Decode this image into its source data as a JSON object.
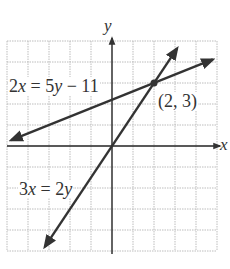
{
  "chart_data": {
    "type": "line",
    "title": "",
    "xlabel": "x",
    "ylabel": "y",
    "xlim": [
      -5,
      5
    ],
    "ylim": [
      -5,
      5
    ],
    "grid": true,
    "grid_step": 1,
    "tick_labels": false,
    "series": [
      {
        "name": "2x = 5y − 11",
        "equation": "y = (2x + 11) / 5",
        "slope": 0.4,
        "intercept": 2.2,
        "x": [
          -4.8,
          4.8
        ],
        "y": [
          0.28,
          4.12
        ]
      },
      {
        "name": "3x = 2y",
        "equation": "y = 1.5x",
        "slope": 1.5,
        "intercept": 0,
        "x": [
          -3.2,
          3.1
        ],
        "y": [
          -4.8,
          4.65
        ]
      }
    ],
    "annotations": [
      {
        "text": "(2, 3)",
        "x": 2,
        "y": 3,
        "type": "intersection-point"
      },
      {
        "text": "2x = 5y − 11",
        "target": "series.0"
      },
      {
        "text": "3x = 2y",
        "target": "series.1"
      }
    ]
  },
  "labels": {
    "x_axis": "x",
    "y_axis": "y",
    "eq1_a": "2",
    "eq1_x": "x",
    "eq1_b": " = 5",
    "eq1_y": "y",
    "eq1_c": " − 11",
    "eq2_a": "3",
    "eq2_x": "x",
    "eq2_b": " = 2",
    "eq2_y": "y",
    "point": "(2, 3)"
  },
  "colors": {
    "line": "#333333",
    "grid": "#bdbdbd",
    "axis": "#222222"
  }
}
